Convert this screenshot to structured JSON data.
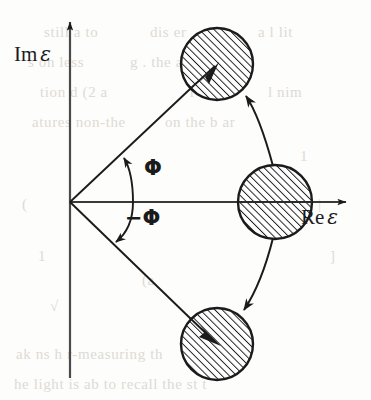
{
  "figure": {
    "background_color": "#fdfdfb",
    "ink_color": "#1b1b1b",
    "width": 371,
    "height": 400
  },
  "axes": {
    "origin": {
      "x": 70,
      "y": 202
    },
    "imaginary": {
      "label_prefix": "Im",
      "label_symbol": "ε",
      "label_full": "Im ε",
      "direction": "up",
      "tip": {
        "x": 70,
        "y": 18
      },
      "tail": {
        "x": 70,
        "y": 378
      },
      "label_pos": {
        "x": 14,
        "y": 44
      }
    },
    "real": {
      "label_prefix": "Re",
      "label_symbol": "ε",
      "label_full": "Re ε",
      "direction": "right",
      "tip": {
        "x": 350,
        "y": 202
      },
      "tail": {
        "x": 70,
        "y": 202
      },
      "label_pos": {
        "x": 301,
        "y": 205
      }
    }
  },
  "angles": [
    {
      "id": "phi-positive",
      "label": "Φ",
      "label_pos": {
        "x": 144,
        "y": 158
      },
      "arc_radius": 63,
      "from_deg": 0,
      "to_deg": 42,
      "arrow_at": "line"
    },
    {
      "id": "phi-negative",
      "label": "−Φ",
      "label_pos": {
        "x": 127,
        "y": 208
      },
      "arc_radius": 63,
      "from_deg": 0,
      "to_deg": -42,
      "arrow_at": "line"
    }
  ],
  "circles": [
    {
      "id": "circle-upper",
      "name": "upper-pole",
      "cx": 217,
      "cy": 64,
      "r": 36,
      "hatch": "diagonal-up-right",
      "has_radial_arrow": true
    },
    {
      "id": "circle-real-axis",
      "name": "real-axis-pole",
      "cx": 275,
      "cy": 202,
      "r": 37,
      "hatch": "diagonal-up-right",
      "has_radial_arrow": false
    },
    {
      "id": "circle-lower",
      "name": "lower-pole",
      "cx": 217,
      "cy": 344,
      "r": 36,
      "hatch": "diagonal-up-right",
      "has_radial_arrow": true
    }
  ],
  "rays": [
    {
      "id": "ray-upper",
      "from": {
        "x": 70,
        "y": 202
      },
      "to": {
        "x": 222,
        "y": 59
      },
      "arrowhead": true
    },
    {
      "id": "ray-lower",
      "from": {
        "x": 70,
        "y": 202
      },
      "to": {
        "x": 222,
        "y": 349
      },
      "arrowhead": true
    }
  ],
  "migration_arrows": [
    {
      "id": "arrow-to-upper",
      "description": "curved arrow from real-axis circle to upper circle",
      "start": {
        "x": 272,
        "y": 165
      },
      "control": {
        "x": 262,
        "y": 122
      },
      "end": {
        "x": 245,
        "y": 92
      },
      "arrowhead": true
    },
    {
      "id": "arrow-to-lower",
      "description": "curved arrow from real-axis circle to lower circle",
      "start": {
        "x": 272,
        "y": 239
      },
      "control": {
        "x": 262,
        "y": 285
      },
      "end": {
        "x": 243,
        "y": 314
      },
      "arrowhead": true
    }
  ],
  "background_ghost_text": [
    {
      "text": "still a         to",
      "x": 44,
      "y": 24
    },
    {
      "text": "dis    er",
      "x": 150,
      "y": 24
    },
    {
      "text": "a  l  lit",
      "x": 258,
      "y": 24
    },
    {
      "text": "s on  less",
      "x": 28,
      "y": 54
    },
    {
      "text": "g . the    a  unit",
      "x": 130,
      "y": 54
    },
    {
      "text": "tion  d  (2 a",
      "x": 40,
      "y": 84
    },
    {
      "text": "r  th",
      "x": 190,
      "y": 84
    },
    {
      "text": "l  nim",
      "x": 268,
      "y": 84
    },
    {
      "text": "atures  non-the",
      "x": 32,
      "y": 114
    },
    {
      "text": "on  the  b    ar",
      "x": 165,
      "y": 114
    },
    {
      "text": "1",
      "x": 300,
      "y": 148
    },
    {
      "text": "(",
      "x": 22,
      "y": 196
    },
    {
      "text": "|",
      "x": 318,
      "y": 196
    },
    {
      "text": "1",
      "x": 38,
      "y": 248
    },
    {
      "text": "]",
      "x": 330,
      "y": 248
    },
    {
      "text": "(a",
      "x": 142,
      "y": 272
    },
    {
      "text": "√",
      "x": 50,
      "y": 298
    },
    {
      "text": "ak   ns  h  r-measuring  th",
      "x": 16,
      "y": 346
    },
    {
      "text": "he  light  is  ab  to  recall  the  st  t",
      "x": 14,
      "y": 376
    }
  ]
}
